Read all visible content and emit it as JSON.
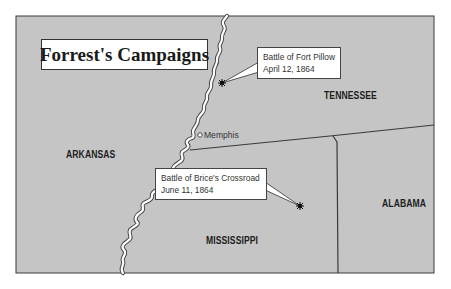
{
  "title": "Forrest's Campaigns",
  "states": [
    {
      "name": "TENNESSEE",
      "x": 324,
      "y": 90
    },
    {
      "name": "ARKANSAS",
      "x": 66,
      "y": 149
    },
    {
      "name": "MISSISSIPPI",
      "x": 206,
      "y": 235
    },
    {
      "name": "ALABAMA",
      "x": 382,
      "y": 198
    }
  ],
  "cities": [
    {
      "name": "Memphis",
      "marker": "open-circle"
    }
  ],
  "battles": [
    {
      "name": "Battle of Fort Pillow",
      "date": "April 12, 1864",
      "marker": "star-burst"
    },
    {
      "name": "Battle of Brice's Crossroad",
      "date": "June 11, 1864",
      "marker": "star-burst"
    }
  ],
  "features": {
    "river": "Mississippi River (unlabeled)"
  },
  "colors": {
    "land": "#c5c5c5",
    "border": "#3a3a3a",
    "river": "#ffffff",
    "river_outline": "#4a4a4a",
    "label_box": "#ffffff"
  }
}
